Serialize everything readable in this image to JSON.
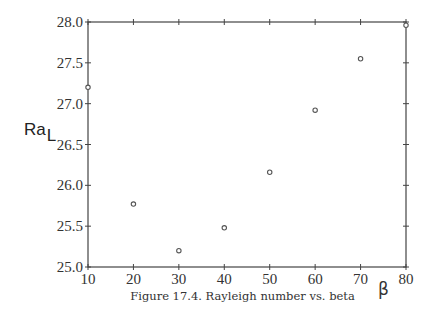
{
  "caption": "Figure 17.4. Rayleigh number vs. beta",
  "chart_data": {
    "type": "scatter",
    "title": "",
    "caption": "Figure 17.4. Rayleigh number vs. beta",
    "xlabel": "β",
    "ylabel": "Ra",
    "ylabel_subscript": "L",
    "x": [
      10,
      20,
      30,
      40,
      50,
      60,
      70,
      80
    ],
    "y": [
      27.2,
      25.77,
      25.2,
      25.48,
      26.16,
      26.92,
      27.55,
      27.96
    ],
    "series": [
      {
        "name": "Ra_L",
        "marker": "open-circle",
        "x": [
          10,
          20,
          30,
          40,
          50,
          60,
          70,
          80
        ],
        "values": [
          27.2,
          25.77,
          25.2,
          25.48,
          26.16,
          26.92,
          27.55,
          27.96
        ]
      }
    ],
    "xlim": [
      10,
      80
    ],
    "ylim": [
      25.0,
      28.0
    ],
    "xticks": [
      10,
      20,
      30,
      40,
      50,
      60,
      70,
      80
    ],
    "xtick_labels": [
      "10",
      "20",
      "30",
      "40",
      "50",
      "60",
      "70",
      "80"
    ],
    "yticks": [
      25.0,
      25.5,
      26.0,
      26.5,
      27.0,
      27.5,
      28.0
    ],
    "ytick_labels": [
      "25.0",
      "25.5",
      "26.0",
      "26.5",
      "27.0",
      "27.5",
      "28.0"
    ],
    "grid": false,
    "legend": null
  },
  "layout": {
    "plot_left": 88,
    "plot_top": 22,
    "plot_width": 318,
    "plot_height": 245
  }
}
